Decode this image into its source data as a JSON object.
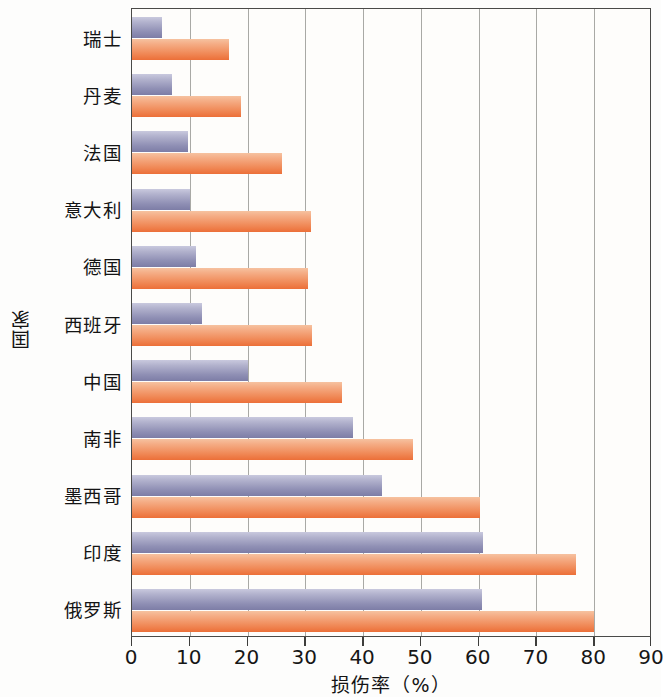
{
  "chart_data": {
    "type": "bar",
    "orientation": "horizontal",
    "title": "",
    "xlabel": "损伤率（%）",
    "ylabel": "国家",
    "xlim": [
      0,
      90
    ],
    "xticks": [
      "0",
      "10",
      "20",
      "30",
      "40",
      "50",
      "60",
      "70",
      "80",
      "90"
    ],
    "grid": true,
    "legend": "none",
    "categories": [
      "瑞士",
      "丹麦",
      "法国",
      "意大利",
      "德国",
      "西班牙",
      "中国",
      "南非",
      "墨西哥",
      "印度",
      "俄罗斯"
    ],
    "series": [
      {
        "name": "series-1",
        "color": "#8f8fb4",
        "values": [
          5.2,
          7.0,
          9.7,
          10.0,
          11.0,
          12.2,
          20.0,
          38.2,
          43.2,
          60.8,
          60.6
        ]
      },
      {
        "name": "series-2",
        "color": "#ef7e49",
        "values": [
          16.8,
          18.8,
          26.0,
          31.0,
          30.5,
          31.2,
          36.4,
          48.7,
          60.2,
          76.8,
          80.0
        ]
      }
    ]
  },
  "axes": {
    "x_title": "损伤率（%）",
    "y_title": "国家"
  }
}
